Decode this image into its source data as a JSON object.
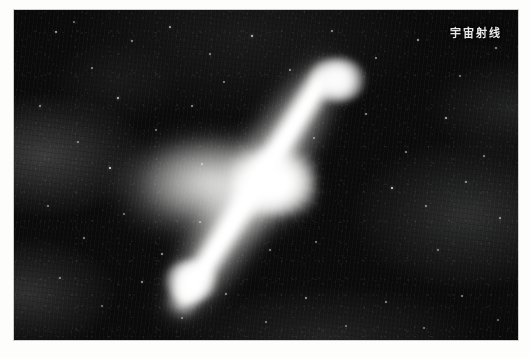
{
  "page": {
    "background_color": "#fdfdfc",
    "type": "printed-photograph"
  },
  "photo": {
    "caption_label": "宇宙射线",
    "caption_position": "top-right",
    "caption_color": "#e9e9e7",
    "background_color": "#0b0b0c",
    "subject": "bipolar astrophysical jet / cosmic ray source",
    "jet_angle_degrees": "-58",
    "nucleus_color": "#ffffff",
    "halo_color": "#cecece"
  },
  "scene": {
    "nucleus_name": "bright-core",
    "jet_ne_name": "upper-right-jet-lobe",
    "jet_sw_name": "lower-left-jet-lobe",
    "halo_name": "diffuse-halo",
    "starfield_name": "background-star-field"
  },
  "stars": [
    {
      "x": 42,
      "y": 22,
      "r": 1.2,
      "o": 0.75
    },
    {
      "x": 78,
      "y": 58,
      "r": 0.9,
      "o": 0.55
    },
    {
      "x": 118,
      "y": 31,
      "r": 1.0,
      "o": 0.6
    },
    {
      "x": 156,
      "y": 17,
      "r": 1.1,
      "o": 0.7
    },
    {
      "x": 196,
      "y": 44,
      "r": 0.8,
      "o": 0.5
    },
    {
      "x": 238,
      "y": 26,
      "r": 1.3,
      "o": 0.85
    },
    {
      "x": 276,
      "y": 60,
      "r": 0.9,
      "o": 0.55
    },
    {
      "x": 318,
      "y": 21,
      "r": 1.0,
      "o": 0.62
    },
    {
      "x": 362,
      "y": 48,
      "r": 0.9,
      "o": 0.52
    },
    {
      "x": 404,
      "y": 30,
      "r": 1.1,
      "o": 0.68
    },
    {
      "x": 446,
      "y": 66,
      "r": 0.8,
      "o": 0.48
    },
    {
      "x": 482,
      "y": 38,
      "r": 1.0,
      "o": 0.6
    },
    {
      "x": 26,
      "y": 96,
      "r": 1.0,
      "o": 0.62
    },
    {
      "x": 64,
      "y": 132,
      "r": 0.9,
      "o": 0.52
    },
    {
      "x": 104,
      "y": 88,
      "r": 1.2,
      "o": 0.78
    },
    {
      "x": 142,
      "y": 120,
      "r": 0.8,
      "o": 0.46
    },
    {
      "x": 178,
      "y": 96,
      "r": 1.0,
      "o": 0.58
    },
    {
      "x": 96,
      "y": 158,
      "r": 1.4,
      "o": 0.92
    },
    {
      "x": 210,
      "y": 72,
      "r": 0.9,
      "o": 0.5
    },
    {
      "x": 352,
      "y": 104,
      "r": 1.0,
      "o": 0.6
    },
    {
      "x": 392,
      "y": 142,
      "r": 0.9,
      "o": 0.54
    },
    {
      "x": 432,
      "y": 108,
      "r": 1.2,
      "o": 0.74
    },
    {
      "x": 470,
      "y": 146,
      "r": 1.0,
      "o": 0.58
    },
    {
      "x": 378,
      "y": 178,
      "r": 1.3,
      "o": 0.88
    },
    {
      "x": 412,
      "y": 196,
      "r": 0.9,
      "o": 0.52
    },
    {
      "x": 452,
      "y": 172,
      "r": 1.0,
      "o": 0.6
    },
    {
      "x": 486,
      "y": 208,
      "r": 1.1,
      "o": 0.66
    },
    {
      "x": 34,
      "y": 196,
      "r": 0.9,
      "o": 0.5
    },
    {
      "x": 70,
      "y": 228,
      "r": 1.0,
      "o": 0.58
    },
    {
      "x": 110,
      "y": 204,
      "r": 0.8,
      "o": 0.44
    },
    {
      "x": 148,
      "y": 244,
      "r": 1.1,
      "o": 0.64
    },
    {
      "x": 186,
      "y": 212,
      "r": 0.9,
      "o": 0.5
    },
    {
      "x": 46,
      "y": 268,
      "r": 1.0,
      "o": 0.56
    },
    {
      "x": 88,
      "y": 296,
      "r": 0.9,
      "o": 0.48
    },
    {
      "x": 128,
      "y": 272,
      "r": 1.1,
      "o": 0.62
    },
    {
      "x": 168,
      "y": 308,
      "r": 0.8,
      "o": 0.44
    },
    {
      "x": 212,
      "y": 284,
      "r": 1.0,
      "o": 0.56
    },
    {
      "x": 252,
      "y": 312,
      "r": 0.9,
      "o": 0.48
    },
    {
      "x": 292,
      "y": 288,
      "r": 1.1,
      "o": 0.62
    },
    {
      "x": 332,
      "y": 316,
      "r": 0.8,
      "o": 0.42
    },
    {
      "x": 372,
      "y": 292,
      "r": 1.0,
      "o": 0.56
    },
    {
      "x": 410,
      "y": 318,
      "r": 0.9,
      "o": 0.46
    },
    {
      "x": 448,
      "y": 286,
      "r": 1.0,
      "o": 0.54
    },
    {
      "x": 484,
      "y": 310,
      "r": 0.9,
      "o": 0.46
    },
    {
      "x": 256,
      "y": 240,
      "r": 1.0,
      "o": 0.55
    },
    {
      "x": 302,
      "y": 232,
      "r": 0.8,
      "o": 0.44
    },
    {
      "x": 188,
      "y": 154,
      "r": 0.9,
      "o": 0.52
    },
    {
      "x": 424,
      "y": 240,
      "r": 1.0,
      "o": 0.58
    },
    {
      "x": 60,
      "y": 12,
      "r": 0.8,
      "o": 0.42
    },
    {
      "x": 300,
      "y": 128,
      "r": 0.9,
      "o": 0.5
    }
  ]
}
